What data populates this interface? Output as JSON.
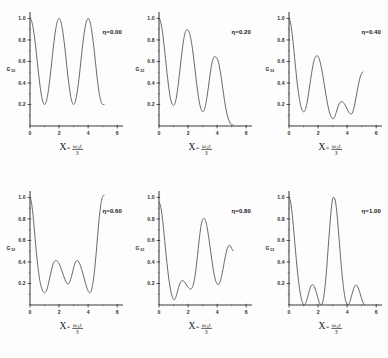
{
  "figure": {
    "name": "multi-panel-plot",
    "background_color": "#fdfdfd",
    "curve_color": "#58585c",
    "axis_color": "#3b3b3f",
    "text_color": "#18181b",
    "rows": 2,
    "cols": 3
  },
  "axes": {
    "xlabel_symbol": "X",
    "xlabel_equals": "=",
    "xlabel_numerator": "ω",
    "xlabel_numerator_sub": "0",
    "xlabel_numerator_var": "t",
    "xlabel_denominator": "3",
    "ylabel": "G",
    "ylabel_sub": "22",
    "xticks": [
      "0",
      "2",
      "4",
      "6"
    ],
    "xtick_values": [
      0,
      2,
      4,
      6
    ],
    "yticks": [
      "0.2",
      "0.4",
      "0.6",
      "0.8",
      "1.0"
    ],
    "ytick_values": [
      0.2,
      0.4,
      0.6,
      0.8,
      1.0
    ],
    "xlim": [
      0,
      6.4
    ],
    "ylim": [
      0,
      1.06
    ],
    "grid": false
  },
  "chart_data": {
    "type": "line",
    "title": "",
    "xlabel": "X = ω₀t/3",
    "ylabel": "G22",
    "xlim": [
      0,
      6.4
    ],
    "ylim": [
      0,
      1.06
    ],
    "grid": false,
    "legend_position": "inset-top-right",
    "panels": [
      {
        "id": "panel-eta-0.00",
        "eta_label": "η=0.00",
        "eta_value": 0.0,
        "x": [
          0.0,
          0.1,
          0.2,
          0.3,
          0.4,
          0.5,
          0.6,
          0.7,
          0.8,
          0.9,
          1.0,
          1.1,
          1.2,
          1.3,
          1.4,
          1.5,
          1.6,
          1.7,
          1.8,
          1.9,
          2.0,
          2.1,
          2.2,
          2.3,
          2.4,
          2.5,
          2.6,
          2.7,
          2.8,
          2.9,
          3.0,
          3.1,
          3.2,
          3.3,
          3.4,
          3.5,
          3.6,
          3.7,
          3.8,
          3.9,
          4.0,
          4.1,
          4.2,
          4.3,
          4.4,
          4.5,
          4.6,
          4.7,
          4.8,
          4.9,
          5.0,
          5.1
        ],
        "y": [
          1.0,
          0.98,
          0.924,
          0.836,
          0.726,
          0.6,
          0.474,
          0.364,
          0.276,
          0.22,
          0.2,
          0.22,
          0.276,
          0.364,
          0.474,
          0.6,
          0.726,
          0.836,
          0.924,
          0.98,
          1.0,
          0.98,
          0.924,
          0.836,
          0.726,
          0.6,
          0.474,
          0.364,
          0.276,
          0.22,
          0.2,
          0.22,
          0.276,
          0.364,
          0.474,
          0.6,
          0.726,
          0.836,
          0.924,
          0.98,
          1.0,
          0.98,
          0.924,
          0.836,
          0.726,
          0.6,
          0.474,
          0.364,
          0.276,
          0.22,
          0.2,
          0.202
        ]
      },
      {
        "id": "panel-eta-0.20",
        "eta_label": "η=0.20",
        "eta_value": 0.2,
        "x": [
          0.0,
          0.1,
          0.2,
          0.3,
          0.4,
          0.5,
          0.6,
          0.7,
          0.8,
          0.9,
          1.0,
          1.1,
          1.2,
          1.3,
          1.4,
          1.5,
          1.6,
          1.7,
          1.8,
          1.9,
          2.0,
          2.1,
          2.2,
          2.3,
          2.4,
          2.5,
          2.6,
          2.7,
          2.8,
          2.9,
          3.0,
          3.1,
          3.2,
          3.3,
          3.4,
          3.5,
          3.6,
          3.7,
          3.8,
          3.9,
          4.0,
          4.1,
          4.2,
          4.3,
          4.4,
          4.5,
          4.6,
          4.7,
          4.8,
          4.9,
          5.0,
          5.1
        ],
        "y": [
          1.0,
          0.975,
          0.91,
          0.81,
          0.69,
          0.56,
          0.435,
          0.33,
          0.25,
          0.205,
          0.19,
          0.21,
          0.268,
          0.36,
          0.475,
          0.595,
          0.71,
          0.805,
          0.868,
          0.893,
          0.89,
          0.862,
          0.805,
          0.72,
          0.615,
          0.5,
          0.385,
          0.285,
          0.205,
          0.155,
          0.133,
          0.145,
          0.192,
          0.268,
          0.363,
          0.465,
          0.552,
          0.615,
          0.645,
          0.64,
          0.63,
          0.59,
          0.52,
          0.435,
          0.34,
          0.245,
          0.165,
          0.1,
          0.055,
          0.025,
          0.012,
          0.01
        ]
      },
      {
        "id": "panel-eta-0.40",
        "eta_label": "η=0.40",
        "eta_value": 0.4,
        "x": [
          0.0,
          0.1,
          0.2,
          0.3,
          0.4,
          0.5,
          0.6,
          0.7,
          0.8,
          0.9,
          1.0,
          1.1,
          1.2,
          1.3,
          1.4,
          1.5,
          1.6,
          1.7,
          1.8,
          1.9,
          2.0,
          2.1,
          2.2,
          2.3,
          2.4,
          2.5,
          2.6,
          2.7,
          2.8,
          2.9,
          3.0,
          3.1,
          3.2,
          3.3,
          3.4,
          3.5,
          3.6,
          3.7,
          3.8,
          3.9,
          4.0,
          4.1,
          4.2,
          4.3,
          4.4,
          4.5,
          4.6,
          4.7,
          4.8,
          4.9,
          5.0,
          5.1
        ],
        "y": [
          1.0,
          0.965,
          0.875,
          0.755,
          0.615,
          0.48,
          0.36,
          0.265,
          0.19,
          0.15,
          0.132,
          0.145,
          0.19,
          0.262,
          0.35,
          0.443,
          0.528,
          0.595,
          0.638,
          0.652,
          0.648,
          0.615,
          0.56,
          0.49,
          0.41,
          0.325,
          0.245,
          0.175,
          0.12,
          0.085,
          0.068,
          0.075,
          0.105,
          0.148,
          0.19,
          0.218,
          0.228,
          0.222,
          0.208,
          0.185,
          0.158,
          0.132,
          0.115,
          0.112,
          0.135,
          0.185,
          0.255,
          0.33,
          0.4,
          0.455,
          0.49,
          0.505
        ]
      },
      {
        "id": "panel-eta-0.60",
        "eta_label": "η=0.60",
        "eta_value": 0.6,
        "x": [
          0.0,
          0.1,
          0.2,
          0.3,
          0.4,
          0.5,
          0.6,
          0.7,
          0.8,
          0.9,
          1.0,
          1.1,
          1.2,
          1.3,
          1.4,
          1.5,
          1.6,
          1.7,
          1.8,
          1.9,
          2.0,
          2.1,
          2.2,
          2.3,
          2.4,
          2.5,
          2.6,
          2.7,
          2.8,
          2.9,
          3.0,
          3.1,
          3.2,
          3.3,
          3.4,
          3.5,
          3.6,
          3.7,
          3.8,
          3.9,
          4.0,
          4.1,
          4.2,
          4.3,
          4.4,
          4.5,
          4.6,
          4.7,
          4.8,
          4.9,
          5.0,
          5.1
        ],
        "y": [
          1.0,
          0.955,
          0.845,
          0.7,
          0.545,
          0.41,
          0.295,
          0.21,
          0.155,
          0.125,
          0.115,
          0.125,
          0.16,
          0.215,
          0.278,
          0.338,
          0.385,
          0.408,
          0.413,
          0.405,
          0.385,
          0.352,
          0.315,
          0.275,
          0.24,
          0.208,
          0.195,
          0.205,
          0.24,
          0.29,
          0.345,
          0.39,
          0.412,
          0.41,
          0.39,
          0.355,
          0.31,
          0.262,
          0.212,
          0.165,
          0.13,
          0.115,
          0.128,
          0.18,
          0.27,
          0.4,
          0.555,
          0.715,
          0.855,
          0.955,
          1.01,
          1.02
        ]
      },
      {
        "id": "panel-eta-0.80",
        "eta_label": "η=0.80",
        "eta_value": 0.8,
        "x": [
          0.0,
          0.1,
          0.2,
          0.3,
          0.4,
          0.5,
          0.6,
          0.7,
          0.8,
          0.9,
          1.0,
          1.1,
          1.2,
          1.3,
          1.4,
          1.5,
          1.6,
          1.7,
          1.8,
          1.9,
          2.0,
          2.1,
          2.2,
          2.3,
          2.4,
          2.5,
          2.6,
          2.7,
          2.8,
          2.9,
          3.0,
          3.1,
          3.2,
          3.3,
          3.4,
          3.5,
          3.6,
          3.7,
          3.8,
          3.9,
          4.0,
          4.1,
          4.2,
          4.3,
          4.4,
          4.5,
          4.6,
          4.7,
          4.8,
          4.9,
          5.0,
          5.1
        ],
        "y": [
          0.955,
          0.925,
          0.845,
          0.725,
          0.59,
          0.45,
          0.325,
          0.22,
          0.14,
          0.082,
          0.052,
          0.055,
          0.09,
          0.14,
          0.185,
          0.215,
          0.228,
          0.222,
          0.205,
          0.185,
          0.165,
          0.152,
          0.148,
          0.165,
          0.21,
          0.29,
          0.4,
          0.525,
          0.645,
          0.742,
          0.795,
          0.805,
          0.785,
          0.73,
          0.648,
          0.552,
          0.455,
          0.36,
          0.28,
          0.225,
          0.196,
          0.192,
          0.215,
          0.265,
          0.33,
          0.405,
          0.472,
          0.525,
          0.552,
          0.552,
          0.525,
          0.505
        ]
      },
      {
        "id": "panel-eta-1.00",
        "eta_label": "η=1.00",
        "eta_value": 1.0,
        "x": [
          0.0,
          0.1,
          0.2,
          0.3,
          0.4,
          0.5,
          0.6,
          0.7,
          0.8,
          0.9,
          1.0,
          1.1,
          1.2,
          1.3,
          1.4,
          1.5,
          1.6,
          1.7,
          1.8,
          1.9,
          2.0,
          2.1,
          2.2,
          2.3,
          2.4,
          2.5,
          2.6,
          2.7,
          2.8,
          2.9,
          3.0,
          3.1,
          3.2,
          3.3,
          3.4,
          3.5,
          3.6,
          3.7,
          3.8,
          3.9,
          4.0,
          4.1,
          4.2,
          4.3,
          4.4,
          4.5,
          4.6,
          4.7,
          4.8,
          4.9,
          5.0,
          5.1,
          5.2
        ],
        "y": [
          1.0,
          0.965,
          0.872,
          0.735,
          0.578,
          0.425,
          0.288,
          0.175,
          0.092,
          0.035,
          0.005,
          0.005,
          0.035,
          0.082,
          0.135,
          0.172,
          0.19,
          0.182,
          0.152,
          0.108,
          0.058,
          0.018,
          0.002,
          0.018,
          0.082,
          0.195,
          0.352,
          0.538,
          0.72,
          0.88,
          0.985,
          1.0,
          0.96,
          0.85,
          0.695,
          0.525,
          0.36,
          0.222,
          0.112,
          0.04,
          0.005,
          0.005,
          0.035,
          0.082,
          0.13,
          0.168,
          0.185,
          0.178,
          0.148,
          0.105,
          0.058,
          0.02,
          0.003
        ]
      }
    ]
  }
}
